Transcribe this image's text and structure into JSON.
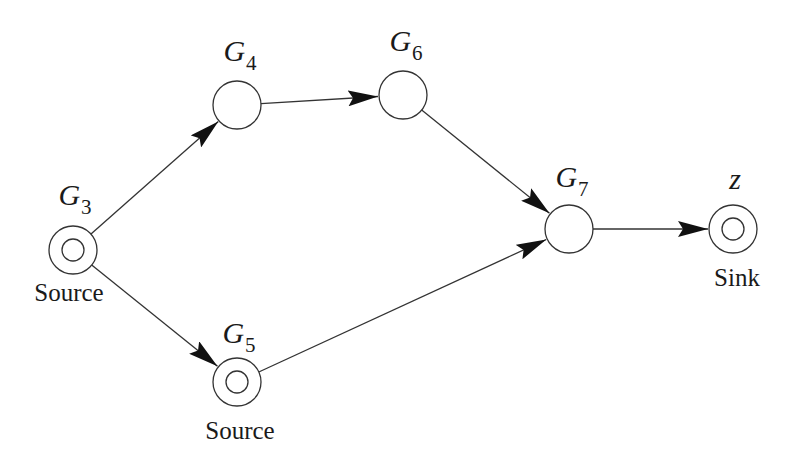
{
  "diagram": {
    "nodes": [
      {
        "id": "G3",
        "name": "G",
        "sub": "3",
        "x": 73,
        "y": 250,
        "type": "double",
        "role": "Source"
      },
      {
        "id": "G4",
        "name": "G",
        "sub": "4",
        "x": 237,
        "y": 105,
        "type": "single",
        "role": ""
      },
      {
        "id": "G6",
        "name": "G",
        "sub": "6",
        "x": 403,
        "y": 95,
        "type": "single",
        "role": ""
      },
      {
        "id": "G7",
        "name": "G",
        "sub": "7",
        "x": 569,
        "y": 229,
        "type": "single",
        "role": ""
      },
      {
        "id": "G5",
        "name": "G",
        "sub": "5",
        "x": 237,
        "y": 382,
        "type": "double",
        "role": "Source"
      },
      {
        "id": "z",
        "name": "z",
        "sub": "",
        "x": 733,
        "y": 229,
        "type": "double",
        "role": "Sink"
      }
    ],
    "edges": [
      {
        "from": "G3",
        "to": "G4"
      },
      {
        "from": "G3",
        "to": "G5"
      },
      {
        "from": "G4",
        "to": "G6"
      },
      {
        "from": "G6",
        "to": "G7"
      },
      {
        "from": "G5",
        "to": "G7"
      },
      {
        "from": "G7",
        "to": "z"
      }
    ],
    "labels": {
      "G3": {
        "name": "G",
        "sub": "3",
        "role": "Source"
      },
      "G4": {
        "name": "G",
        "sub": "4"
      },
      "G5": {
        "name": "G",
        "sub": "5",
        "role": "Source"
      },
      "G6": {
        "name": "G",
        "sub": "6"
      },
      "G7": {
        "name": "G",
        "sub": "7"
      },
      "z": {
        "name": "z",
        "role": "Sink"
      }
    },
    "colors": {
      "stroke": "#333333",
      "arrow": "#111111",
      "background": "#ffffff"
    }
  }
}
